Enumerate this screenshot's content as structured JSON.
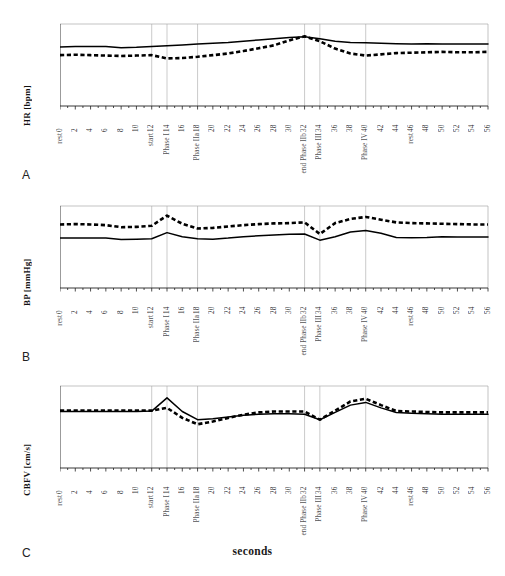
{
  "figure": {
    "xaxis_title": "seconds",
    "panel_letters": [
      "A",
      "B",
      "C"
    ]
  },
  "axis": {
    "tick_values": [
      0,
      2,
      4,
      6,
      8,
      10,
      12,
      14,
      16,
      18,
      20,
      22,
      24,
      26,
      28,
      30,
      32,
      34,
      36,
      38,
      40,
      42,
      44,
      46,
      48,
      50,
      52,
      54,
      56
    ],
    "tick_labels": [
      "0",
      "2",
      "4",
      "6",
      "8",
      "10",
      "12",
      "14",
      "16",
      "18",
      "20",
      "22",
      "24",
      "26",
      "28",
      "30",
      "32",
      "34",
      "36",
      "38",
      "40",
      "42",
      "44",
      "46",
      "48",
      "50",
      "52",
      "54",
      "56"
    ],
    "phase_annotations": [
      {
        "at": 0,
        "label": "rest"
      },
      {
        "at": 12,
        "label": "start"
      },
      {
        "at": 14,
        "label": "Phase I"
      },
      {
        "at": 18,
        "label": "Phase IIa"
      },
      {
        "at": 32,
        "label": "end Phase IIb"
      },
      {
        "at": 34,
        "label": "Phase III"
      },
      {
        "at": 40,
        "label": "Phase IV"
      },
      {
        "at": 46,
        "label": "rest"
      }
    ],
    "vertical_markers": [
      12,
      14,
      18,
      32,
      34,
      40
    ],
    "xmin": 0,
    "xmax": 56
  },
  "chart_data": [
    {
      "type": "line",
      "id": "hr",
      "panel": "A",
      "title": "",
      "ylabel": "HR [bpm]",
      "xlabel": "seconds",
      "ylim": [
        0,
        100
      ],
      "ytick_step": 10,
      "yticks": [
        0,
        10,
        20,
        30,
        40,
        50,
        60,
        70,
        80,
        90,
        100
      ],
      "xlim": [
        0,
        56
      ],
      "grid": false,
      "legend": "none",
      "x": [
        0,
        2,
        4,
        6,
        8,
        10,
        12,
        14,
        16,
        18,
        20,
        22,
        24,
        26,
        28,
        30,
        32,
        34,
        36,
        38,
        40,
        42,
        44,
        46,
        48,
        50,
        52,
        54,
        56
      ],
      "series": [
        {
          "name": "solid",
          "style": "solid",
          "values": [
            72,
            72.5,
            72.5,
            72.5,
            71,
            71.5,
            72.5,
            73.5,
            74.5,
            75.5,
            76.5,
            77.5,
            79,
            80.5,
            82,
            83.5,
            84.5,
            82,
            79,
            77.5,
            77,
            76.5,
            76,
            75.5,
            76,
            75.5,
            75.5,
            75.5,
            75.5
          ]
        },
        {
          "name": "dashed",
          "style": "dashed",
          "values": [
            62,
            62.5,
            62,
            61.5,
            61,
            61.5,
            62,
            58,
            58.5,
            60,
            62,
            64,
            67,
            70.5,
            74,
            80,
            85,
            79,
            70,
            64,
            61.5,
            63,
            64.5,
            65,
            65.5,
            66,
            65.5,
            65.5,
            66
          ]
        }
      ]
    },
    {
      "type": "line",
      "id": "bp",
      "panel": "B",
      "title": "",
      "ylabel": "BP [mmHg]",
      "xlabel": "seconds",
      "ylim": [
        0,
        120
      ],
      "ytick_step": 20,
      "yticks": [
        0,
        20,
        40,
        60,
        80,
        100,
        120
      ],
      "xlim": [
        0,
        56
      ],
      "grid": false,
      "legend": "none",
      "x": [
        0,
        2,
        4,
        6,
        8,
        10,
        12,
        14,
        16,
        18,
        20,
        22,
        24,
        26,
        28,
        30,
        32,
        34,
        36,
        38,
        40,
        42,
        44,
        46,
        48,
        50,
        52,
        54,
        56
      ],
      "series": [
        {
          "name": "solid",
          "style": "solid",
          "values": [
            73,
            73,
            73,
            73,
            71,
            71.5,
            72,
            81,
            75,
            72,
            71.5,
            73,
            75,
            76.5,
            77.5,
            78.5,
            79,
            70,
            75,
            82,
            84,
            80,
            74,
            73.5,
            74,
            75,
            74.5,
            74.5,
            74.5
          ]
        },
        {
          "name": "dashed",
          "style": "dashed",
          "values": [
            93,
            93.5,
            93,
            92,
            89,
            89.5,
            91,
            106,
            94,
            87,
            88,
            90,
            92,
            93.5,
            94.5,
            95,
            96,
            79,
            95,
            101,
            104,
            100,
            96,
            95,
            94.5,
            94,
            93.5,
            93,
            93
          ]
        }
      ]
    },
    {
      "type": "line",
      "id": "cbfv",
      "panel": "C",
      "title": "",
      "ylabel": "CBFV [cm/s]",
      "xlabel": "seconds",
      "ylim": [
        0,
        90
      ],
      "ytick_step": 10,
      "yticks": [
        0,
        10,
        20,
        30,
        40,
        50,
        60,
        70,
        80,
        90
      ],
      "xlim": [
        0,
        56
      ],
      "grid": false,
      "legend": "none",
      "x": [
        0,
        2,
        4,
        6,
        8,
        10,
        12,
        14,
        16,
        18,
        20,
        22,
        24,
        26,
        28,
        30,
        32,
        34,
        36,
        38,
        40,
        42,
        44,
        46,
        48,
        50,
        52,
        54,
        56
      ],
      "series": [
        {
          "name": "solid",
          "style": "solid",
          "values": [
            62,
            62,
            62,
            62,
            62,
            62,
            62.5,
            77,
            62,
            53,
            54,
            56,
            58,
            59,
            59.5,
            59.5,
            59,
            53,
            61,
            69,
            72,
            66,
            61,
            60,
            59.5,
            59,
            59,
            59,
            59
          ]
        },
        {
          "name": "dashed",
          "style": "dashed",
          "values": [
            63,
            63,
            63,
            63,
            63,
            63,
            63,
            66,
            55,
            48,
            51,
            55,
            58.5,
            61,
            62,
            62,
            62,
            53,
            63,
            73,
            76,
            69,
            62.5,
            62,
            61.5,
            61,
            61,
            61,
            61
          ]
        }
      ]
    }
  ]
}
